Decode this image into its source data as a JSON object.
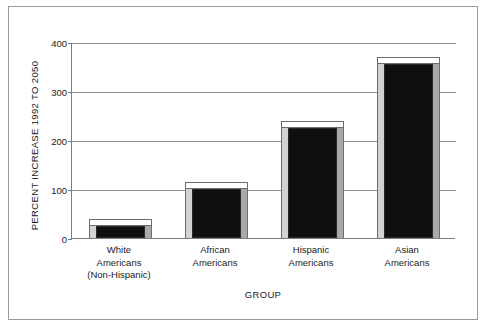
{
  "chart_data": {
    "type": "bar",
    "title": "",
    "xlabel": "GROUP",
    "ylabel": "PERCENT INCREASE 1992 TO 2050",
    "categories": [
      "White Americans (Non-Hispanic)",
      "African Americans",
      "Hispanic Americans",
      "Asian Americans"
    ],
    "category_lines": [
      [
        "White",
        "Americans",
        "(Non-Hispanic)"
      ],
      [
        "African",
        "Americans"
      ],
      [
        "Hispanic",
        "Americans"
      ],
      [
        "Asian",
        "Americans"
      ]
    ],
    "values": [
      25,
      100,
      225,
      355
    ],
    "ylim": [
      0,
      400
    ],
    "yticks": [
      0,
      100,
      200,
      300,
      400
    ],
    "ytick_labels": [
      "0",
      "100",
      "200",
      "300",
      "400"
    ],
    "grid": true,
    "legend": "none",
    "style": "3d-bars",
    "colors": {
      "bar_front": "#100f0f",
      "bar_top": "#ffffff",
      "bar_left": "#d2d2d2",
      "bar_right": "#a9a9a9",
      "axis": "#7d7d7d",
      "gridline": "#8f8f8f",
      "frame": "#9a9a9a",
      "text": "#1a1a1a",
      "background": "#ffffff"
    }
  }
}
